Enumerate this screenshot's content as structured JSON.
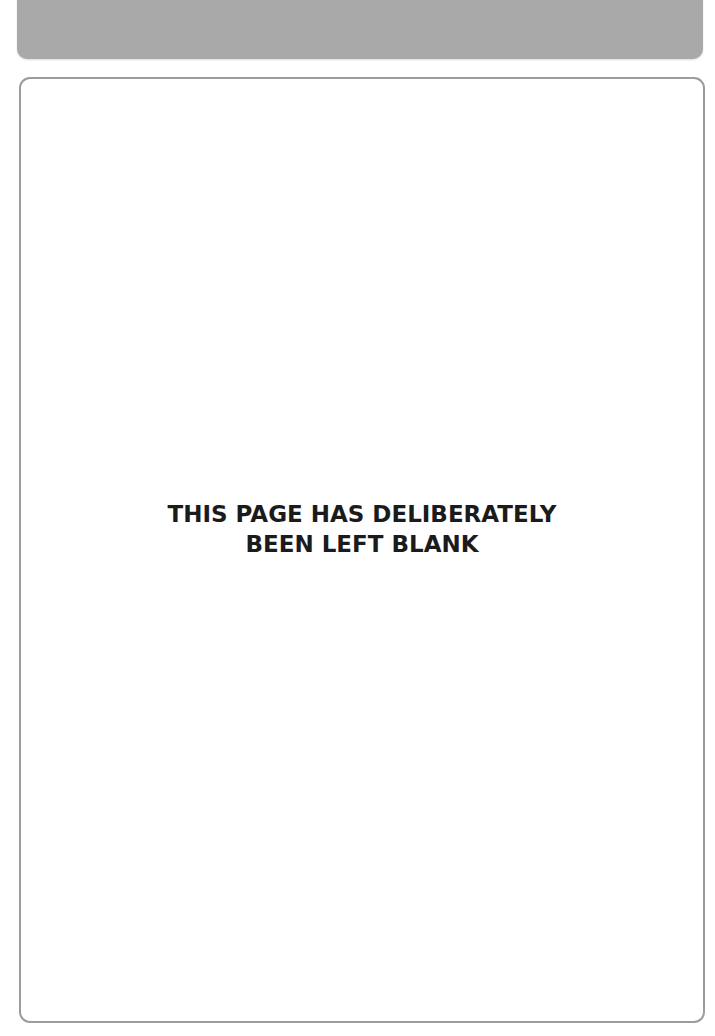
{
  "header": {
    "band_color": "#a9a9a9"
  },
  "page": {
    "frame_border_color": "#9c9c9c",
    "notice": {
      "line1": "THIS PAGE HAS DELIBERATELY",
      "line2": "BEEN LEFT BLANK"
    }
  }
}
